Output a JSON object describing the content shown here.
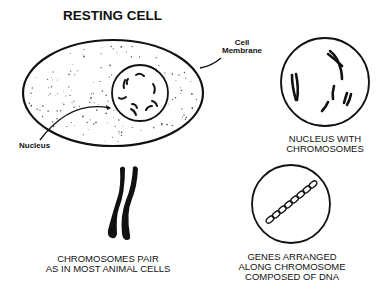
{
  "title": "RESTING CELL",
  "labels": {
    "cell_membrane_line1": "Cell",
    "cell_membrane_line2": "Membrane",
    "nucleus": "Nucleus"
  },
  "captions": {
    "nucleus_with_chromosomes": [
      "NUCLEUS WITH",
      "CHROMOSOMES"
    ],
    "chromosomes_pair": [
      "CHROMOSOMES PAIR",
      "AS IN MOST ANIMAL CELLS"
    ],
    "genes_arranged": [
      "GENES ARRANGED",
      "ALONG CHROMOSOME",
      "COMPOSED OF DNA"
    ]
  },
  "colors": {
    "ink": "#111111",
    "background": "#ffffff"
  }
}
